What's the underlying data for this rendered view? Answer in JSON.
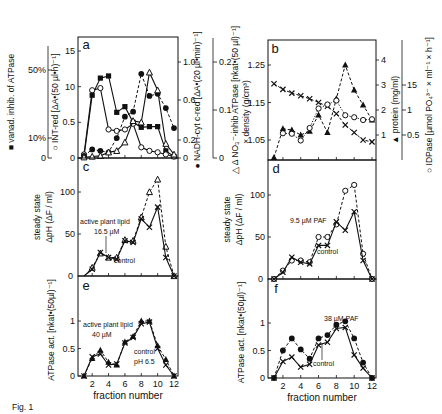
{
  "figure": {
    "caption_fragment": "Fig. 1",
    "xlabel": "fraction number",
    "xticks": [
      "2",
      "4",
      "6",
      "8",
      "10",
      "12"
    ]
  },
  "chart_data": [
    {
      "panel": "a",
      "type": "line",
      "x": [
        1,
        2,
        3,
        4,
        5,
        6,
        7,
        8,
        9,
        10,
        11,
        12
      ],
      "xlabel": "fraction number",
      "axes": {
        "left_outer": {
          "label": "vanad. inhib. of ATPase",
          "ticks": [
            "0",
            "10%",
            "50%"
          ]
        },
        "left_inner": {
          "label": "INT-red [ΔA•(50 µl•h)⁻¹]",
          "ticks": [
            "0",
            "0.5",
            "1.0",
            "1.5"
          ],
          "ylim": [
            0,
            1.5
          ]
        },
        "right_inner": {
          "label": "NADH-cyt c-red [ΔA•(20 µl•min)⁻¹]",
          "ticks": [
            "0",
            "0.2",
            "0.6",
            "1.0"
          ]
        },
        "right_outer": {
          "label": "Δ NO₃⁻-inhib ATPase [nkat•(50 µl)⁻¹]",
          "ticks": [
            "0",
            "0.1",
            "0.2"
          ]
        }
      },
      "series": [
        {
          "name": "vanad. inhib. of ATPase",
          "marker": "filled-square",
          "line": "solid",
          "values": [
            0.02,
            0.88,
            1.12,
            1.15,
            0.64,
            0.72,
            0.5,
            0.43,
            0.44,
            0.44,
            0.1,
            0.02
          ]
        },
        {
          "name": "INT-red",
          "marker": "open-circle",
          "line": "solid",
          "values": [
            0.05,
            0.95,
            0.98,
            0.4,
            0.38,
            0.4,
            0.48,
            0.15,
            0.1,
            0.08,
            0.05,
            0.02
          ]
        },
        {
          "name": "NADH-cyt c-red",
          "marker": "filled-circle",
          "line": "dashed",
          "values": [
            0.03,
            0.12,
            0.1,
            0.08,
            0.28,
            0.58,
            0.65,
            1.18,
            0.87,
            0.9,
            0.7,
            0.42
          ]
        },
        {
          "name": "Δ NO₃⁻-inhib ATPase",
          "marker": "open-triangle",
          "line": "solid",
          "values": [
            0.01,
            0.02,
            0.03,
            0.08,
            0.1,
            0.22,
            0.52,
            0.5,
            1.2,
            0.95,
            0.2,
            0.05
          ]
        }
      ]
    },
    {
      "panel": "b",
      "type": "line",
      "x": [
        1,
        2,
        3,
        4,
        5,
        6,
        7,
        8,
        9,
        10,
        11,
        12
      ],
      "axes": {
        "left": {
          "label": "× density (g/cm³)",
          "ticks": [
            "1.05",
            "1.15",
            "1.25"
          ]
        },
        "right_inner": {
          "label": "▲ protein (mg/ml)",
          "ticks": [
            "1",
            "2",
            "3",
            "4"
          ]
        },
        "right_outer": {
          "label": "○ IDPase [µmol PO₄³⁻ × ml⁻¹ × h⁻¹]",
          "ticks": [
            "0.5",
            "1",
            "1.5"
          ]
        }
      },
      "series": [
        {
          "name": "density",
          "marker": "cross",
          "line": "dashed",
          "values": [
            1.2,
            1.185,
            1.175,
            1.168,
            1.16,
            1.15,
            1.14,
            1.12,
            1.09,
            1.07,
            1.05,
            1.045
          ]
        },
        {
          "name": "protein",
          "marker": "filled-triangle",
          "line": "dashed",
          "values": [
            0.1,
            1.25,
            1.2,
            1.0,
            1.15,
            1.8,
            1.1,
            2.45,
            3.8,
            2.8,
            2.2,
            1.6
          ]
        },
        {
          "name": "IDPase",
          "marker": "open-circle",
          "line": "dotted",
          "values": [
            null,
            1.07,
            1.05,
            0.78,
            1.28,
            2.06,
            2.22,
            2.38,
            1.79,
            1.71,
            1.6,
            1.63
          ]
        }
      ]
    },
    {
      "panel": "c",
      "type": "line",
      "x": [
        1,
        2,
        3,
        4,
        5,
        6,
        7,
        8,
        9,
        10,
        11,
        12
      ],
      "ylabel": "steady state ΔpH (ΔF/ml)",
      "yticks": [
        "50",
        "100"
      ],
      "annotations": [
        "active plant lipid",
        "16.5 µM",
        "control"
      ],
      "series": [
        {
          "name": "active plant lipid 16.5 µM",
          "marker": "open-triangle",
          "line": "dashed",
          "values": [
            0,
            10,
            27,
            22,
            22,
            43,
            42,
            70,
            100,
            115,
            35,
            0
          ]
        },
        {
          "name": "control",
          "marker": "cross",
          "line": "solid",
          "values": [
            0,
            8,
            28,
            22,
            20,
            42,
            40,
            68,
            58,
            82,
            22,
            0
          ]
        }
      ]
    },
    {
      "panel": "d",
      "type": "line",
      "x": [
        1,
        2,
        3,
        4,
        5,
        6,
        7,
        8,
        9,
        10,
        11,
        12
      ],
      "ylabel": "steady state ΔpH (ΔF/ml)",
      "yticks": [
        "50",
        "100"
      ],
      "annotations": [
        "9.5 µM PAF",
        "control"
      ],
      "series": [
        {
          "name": "9.5 µM PAF",
          "marker": "open-circle",
          "line": "dashed",
          "values": [
            0,
            10,
            22,
            22,
            20,
            50,
            50,
            65,
            105,
            112,
            30,
            0
          ]
        },
        {
          "name": "control",
          "marker": "cross",
          "line": "solid",
          "values": [
            0,
            8,
            26,
            20,
            18,
            40,
            40,
            68,
            58,
            80,
            22,
            0
          ]
        }
      ]
    },
    {
      "panel": "e",
      "type": "line",
      "x": [
        1,
        2,
        3,
        4,
        5,
        6,
        7,
        8,
        9,
        10,
        11,
        12
      ],
      "ylabel": "ATPase act. [nkat•(50 µl)⁻¹]",
      "yticks": [
        "0",
        "0.5",
        "1"
      ],
      "annotations": [
        "active plant lipid",
        "40 µM",
        "control",
        "pH 6.5"
      ],
      "series": [
        {
          "name": "active plant lipid 40 µM",
          "marker": "filled-triangle",
          "line": "dashed",
          "values": [
            0,
            0.32,
            0.47,
            0.25,
            0.2,
            0.62,
            0.72,
            1.0,
            1.0,
            0.55,
            0.3,
            0
          ]
        },
        {
          "name": "control pH 6.5",
          "marker": "cross",
          "line": "solid",
          "values": [
            0,
            0.35,
            0.4,
            0.2,
            0.22,
            0.6,
            0.7,
            0.95,
            0.98,
            0.5,
            0.2,
            0
          ]
        }
      ]
    },
    {
      "panel": "f",
      "type": "line",
      "x": [
        1,
        2,
        3,
        4,
        5,
        6,
        7,
        8,
        9,
        10,
        11,
        12
      ],
      "ylabel": "ATPase act. [nkat•(50 µl)⁻¹]",
      "yticks": [
        "0",
        "0.5",
        "1"
      ],
      "annotations": [
        "38 µM PAF",
        "control"
      ],
      "series": [
        {
          "name": "38 µM PAF",
          "marker": "filled-circle",
          "line": "dashed",
          "values": [
            0,
            0.5,
            0.72,
            0.52,
            0.35,
            0.72,
            0.78,
            0.97,
            1.03,
            0.72,
            0.28,
            0
          ]
        },
        {
          "name": "control",
          "marker": "cross",
          "line": "solid",
          "values": [
            0,
            0.3,
            0.38,
            0.2,
            0.25,
            0.6,
            0.65,
            0.9,
            0.92,
            0.42,
            0.18,
            0
          ]
        }
      ]
    }
  ]
}
